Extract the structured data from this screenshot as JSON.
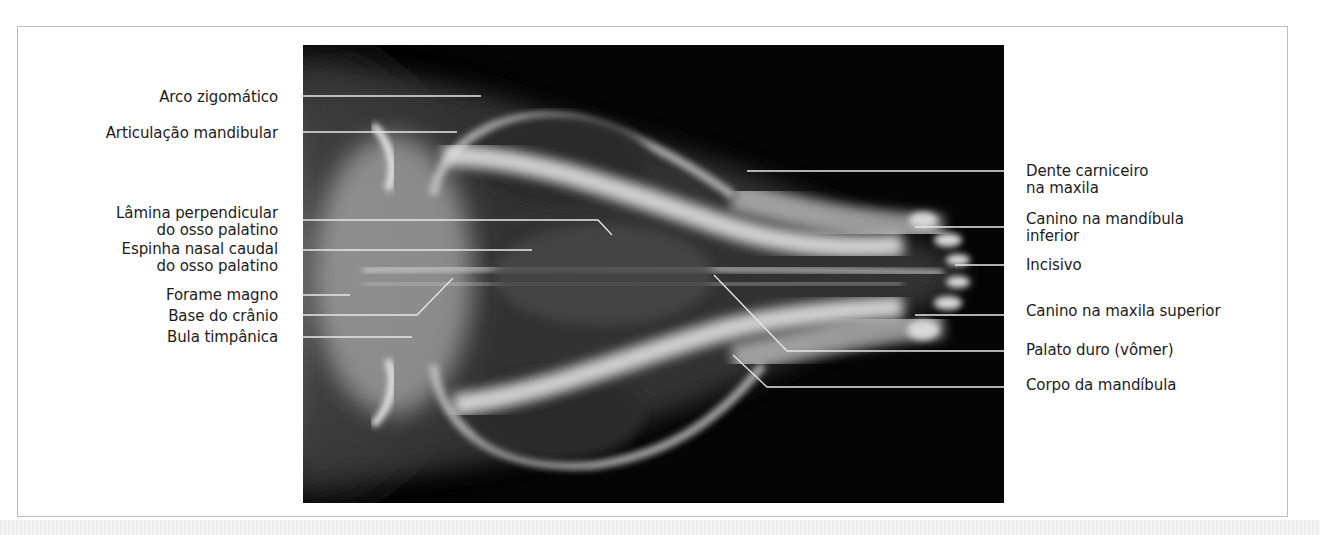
{
  "figure": {
    "type": "annotated radiograph",
    "colors": {
      "background": "#ffffff",
      "frame_border": "#bdbdbd",
      "radiograph_bg": "#050505",
      "leader_line": "#e8e8e8",
      "label_text": "#1c1c1c"
    }
  },
  "labels": {
    "left": [
      {
        "text": "Arco zigomático"
      },
      {
        "text": "Articulação mandibular"
      },
      {
        "line1": "Lâmina perpendicular",
        "line2": "do osso palatino"
      },
      {
        "line1": "Espinha nasal caudal",
        "line2": "do osso palatino"
      },
      {
        "text": "Forame magno"
      },
      {
        "text": "Base do crânio"
      },
      {
        "text": "Bula timpânica"
      }
    ],
    "right": [
      {
        "line1": "Dente carniceiro",
        "line2": "na maxila"
      },
      {
        "line1": "Canino na mandíbula",
        "line2": "inferior"
      },
      {
        "text": "Incisivo"
      },
      {
        "text": "Canino na maxila superior"
      },
      {
        "text": "Palato duro (vômer)"
      },
      {
        "text": "Corpo da mandíbula"
      }
    ]
  },
  "caption": {
    "visible_text": ""
  }
}
